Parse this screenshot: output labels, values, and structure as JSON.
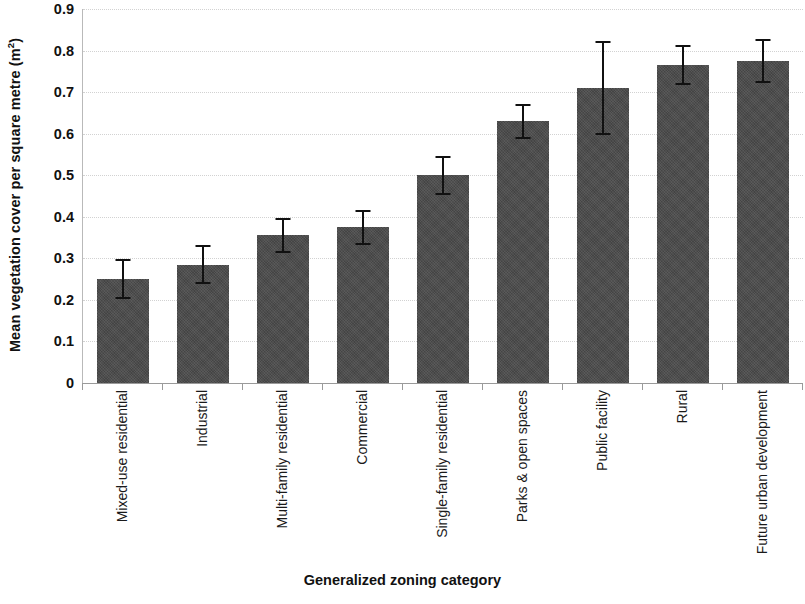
{
  "chart_data": {
    "type": "bar",
    "title": "",
    "xlabel": "Generalized zoning category",
    "ylabel": "Mean vegetation cover per square metre (m²)",
    "ylabel_main": "Mean vegetation cover per square metre (m",
    "ylabel_sup": "2",
    "ylabel_tail": ")",
    "categories": [
      "Mixed-use residential",
      "Industrial",
      "Multi-family residential",
      "Commercial",
      "Single-family residential",
      "Parks & open spaces",
      "Public facility",
      "Rural",
      "Future urban development"
    ],
    "values": [
      0.25,
      0.285,
      0.355,
      0.375,
      0.5,
      0.63,
      0.71,
      0.765,
      0.775
    ],
    "errors": [
      0.045,
      0.045,
      0.04,
      0.04,
      0.045,
      0.04,
      0.11,
      0.045,
      0.05
    ],
    "error_low": [
      0.205,
      0.24,
      0.315,
      0.335,
      0.455,
      0.59,
      0.6,
      0.72,
      0.725
    ],
    "error_high": [
      0.295,
      0.33,
      0.395,
      0.415,
      0.545,
      0.67,
      0.82,
      0.81,
      0.825
    ],
    "ylim": [
      0,
      0.9
    ],
    "ytick_values": [
      0,
      0.1,
      0.2,
      0.3,
      0.4,
      0.5,
      0.6,
      0.7,
      0.8,
      0.9
    ],
    "ytick_labels": [
      "0",
      "0.1",
      "0.2",
      "0.3",
      "0.4",
      "0.5",
      "0.6",
      "0.7",
      "0.8",
      "0.9"
    ],
    "grid": true,
    "grid_style": "dotted",
    "legend": null,
    "bar_color": "#4b4b4b",
    "error_bar_color": "#111111",
    "grid_color": "#d2d2d2",
    "axis_color": "#9a9a9a",
    "text_color": "#111111",
    "background_color": "#ffffff"
  }
}
